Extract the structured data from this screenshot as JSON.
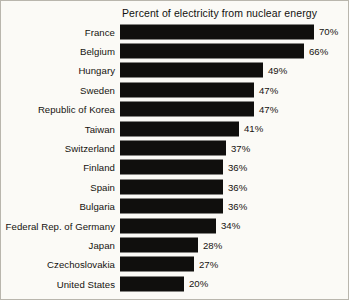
{
  "chart_data": {
    "type": "bar",
    "title": "Percent of electricity from nuclear energy",
    "xlabel": "",
    "ylabel": "",
    "orientation": "horizontal",
    "grid": false,
    "legend": "none",
    "unit": "%",
    "xlim": [
      0,
      70
    ],
    "categories": [
      "France",
      "Belgium",
      "Hungary",
      "Sweden",
      "Republic of Korea",
      "Taiwan",
      "Switzerland",
      "Finland",
      "Spain",
      "Bulgaria",
      "Federal Rep. of Germany",
      "Japan",
      "Czechoslovakia",
      "United States"
    ],
    "values": [
      70,
      66,
      49,
      47,
      47,
      41,
      37,
      36,
      36,
      36,
      34,
      28,
      27,
      20
    ],
    "value_labels": [
      "70%",
      "66%",
      "49%",
      "47%",
      "47%",
      "41%",
      "37%",
      "36%",
      "36%",
      "36%",
      "34%",
      "28%",
      "27%",
      "20%"
    ],
    "bar_pixel_widths": [
      194,
      184,
      143,
      134,
      134,
      119,
      106,
      103,
      103,
      103,
      96,
      78,
      74,
      64
    ],
    "bar_color": "#100f0d",
    "background_color": "#fbfaf6"
  }
}
